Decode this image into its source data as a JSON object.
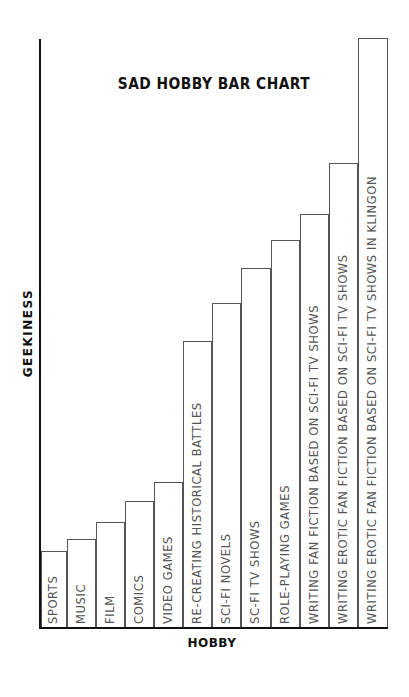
{
  "chart_data": {
    "type": "bar",
    "title": "SAD HOBBY BAR CHART",
    "xlabel": "HOBBY",
    "ylabel": "GEEKINESS",
    "categories": [
      "SPORTS",
      "MUSIC",
      "FILM",
      "COMICS",
      "VIDEO GAMES",
      "RE-CREATING HISTORICAL BATTLES",
      "SCI-FI NOVELS",
      "SC-FI TV SHOWS",
      "ROLE-PLAYING GAMES",
      "WRITING FAN FICTION BASED ON SCI-FI TV SHOWS",
      "WRITING EROTIC FAN FICTION BASED ON SCI-FI TV SHOWS",
      "WRITING EROTIC FAN FICTION BASED ON SCI-FI TV SHOWS IN KLINGON"
    ],
    "values": [
      76,
      88,
      105,
      126,
      145,
      286,
      324,
      359,
      387,
      413,
      464,
      589
    ],
    "value_units": "pixel height (no numeric axis shown)",
    "ylim": [
      0,
      590
    ],
    "grid": false,
    "legend": null,
    "bar_fill": "#ffffff",
    "bar_stroke": "#555555",
    "axis_color": "#111111"
  },
  "bars_geometry": [
    {
      "left": 41,
      "width": 26
    },
    {
      "left": 67,
      "width": 29
    },
    {
      "left": 96,
      "width": 29
    },
    {
      "left": 125,
      "width": 29
    },
    {
      "left": 154,
      "width": 29
    },
    {
      "left": 183,
      "width": 29
    },
    {
      "left": 212,
      "width": 29
    },
    {
      "left": 241,
      "width": 30
    },
    {
      "left": 271,
      "width": 29
    },
    {
      "left": 300,
      "width": 29
    },
    {
      "left": 329,
      "width": 29
    },
    {
      "left": 358,
      "width": 30
    }
  ]
}
